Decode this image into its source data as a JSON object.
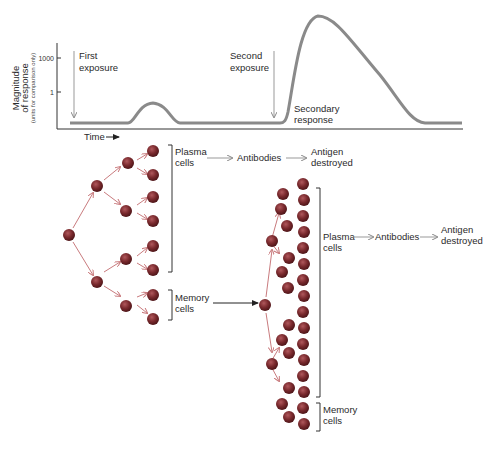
{
  "graph": {
    "y_axis_label_line1": "Magnitude",
    "y_axis_label_line2": "of response",
    "y_axis_label_note": "(units for comparison only)",
    "y_ticks": [
      "1000",
      "1"
    ],
    "x_axis_label": "Time",
    "first_exposure_line1": "First",
    "first_exposure_line2": "exposure",
    "second_exposure_line1": "Second",
    "second_exposure_line2": "exposure",
    "secondary_response_line1": "Secondary",
    "secondary_response_line2": "response"
  },
  "primary": {
    "plasma_line1": "Plasma",
    "plasma_line2": "cells",
    "antibodies": "Antibodies",
    "antigen_line1": "Antigen",
    "antigen_line2": "destroyed",
    "memory_line1": "Memory",
    "memory_line2": "cells"
  },
  "secondary": {
    "plasma_line1": "Plasma",
    "plasma_line2": "cells",
    "antibodies": "Antibodies",
    "antigen_line1": "Antigen",
    "antigen_line2": "destroyed",
    "memory_line1": "Memory",
    "memory_line2": "cells"
  },
  "colors": {
    "cell": "#7a1f24",
    "arrow": "#c97b7e",
    "curve": "#8a8a8a",
    "axis": "#333333"
  }
}
